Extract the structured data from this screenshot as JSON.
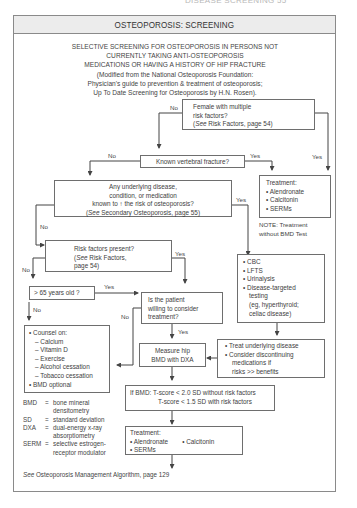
{
  "running_head": "DISEASE SCREENING  55",
  "title": "OSTEOPOROSIS: SCREENING",
  "intro": [
    "SELECTIVE SCREENING FOR OSTEOPOROSIS IN PERSONS NOT",
    "CURRENTLY TAKING ANTI-OSTEOPOROSIS",
    "MEDICATIONS OR HAVING A HISTORY OF HIP FRACTURE",
    "(Modified from the National Osteoporosis Foundation:",
    "Physician's guide to prevention & treatment of osteoporosis;",
    "Up To Date Screening for Osteoporosis by H.N. Rosen)."
  ],
  "nodes": {
    "female": {
      "lines": [
        "Female with multiple",
        "risk factors?"
      ],
      "ref_see": "See",
      "ref_rest": " Risk Factors, page 54)",
      "ref_open": "("
    },
    "vertebral": {
      "text": "Known vertebral fracture?"
    },
    "treatment_top": {
      "heading": "Treatment:",
      "items": [
        "Alendronate",
        "Calcitonin",
        "SERMs"
      ]
    },
    "note": {
      "lines": [
        "NOTE: Treatment",
        "without BMD Test"
      ]
    },
    "underlying": {
      "lines": [
        "Any underlying disease,",
        "condition, or medication",
        "known to ↑ the risk of osteoporosis?"
      ],
      "ref_open": "(",
      "ref_see": "See",
      "ref_rest": " Secondary Osteoporosis, page 55)"
    },
    "risk": {
      "line1": "Risk factors present?",
      "ref_open": "(",
      "ref_see": "See",
      "ref_rest": " Risk Factors,",
      "line3": "page 54)"
    },
    "labs": {
      "items": [
        "CBC",
        "LFTS",
        "Urinalysis",
        "Disease-targeted"
      ],
      "extra": [
        "testing",
        "(eg, hyperthyroid;",
        "celiac disease)"
      ]
    },
    "age": {
      "text": "> 65 years old ?"
    },
    "willing": {
      "lines": [
        "Is the patient",
        "willing to consider",
        "treatment?"
      ]
    },
    "counsel": {
      "heading": "Counsel on:",
      "subitems": [
        "Calcium",
        "Vitamin D",
        "Exercise",
        "Alcohol cessation",
        "Tobacco cessation"
      ],
      "last": "BMD optional"
    },
    "measure": {
      "lines": [
        "Measure hip",
        "BMD with DXA"
      ]
    },
    "treat_underlying": {
      "items": [
        "Treat underlying disease",
        "Consider discontinuing"
      ],
      "extra": [
        "medications if",
        "risks >> benefits"
      ]
    },
    "bmd": {
      "line1": "If BMD: T-score < 2.0 SD without risk factors",
      "line2": "T-score < 1.5 SD with risk factors"
    },
    "treatment_bottom": {
      "heading": "Treatment:",
      "items": [
        "Alendronate",
        "Calcitonin",
        "SERMs"
      ]
    }
  },
  "edge_labels": {
    "female_no": "No",
    "female_yes": "Yes",
    "vertebral_no": "No",
    "vertebral_yes": "Yes",
    "underlying_yes": "Yes",
    "underlying_no": "No",
    "risk_yes": "Yes",
    "risk_no": "No",
    "age_yes": "Yes",
    "age_no": "No",
    "willing_no": "No",
    "willing_yes": "Yes"
  },
  "legend": [
    {
      "abbr": "BMD",
      "def": [
        "bone mineral",
        "densitometry"
      ]
    },
    {
      "abbr": "SD",
      "def": [
        "standard deviation"
      ]
    },
    {
      "abbr": "DXA",
      "def": [
        "dual-energy x-ray",
        "absorptiometry"
      ]
    },
    {
      "abbr": "SERM",
      "def": [
        "selective estrogen-",
        "receptor modulator"
      ]
    }
  ],
  "footer": {
    "see": "See",
    "rest": " Osteoporosis Management Algorithm, page 129"
  },
  "colors": {
    "line": "#444444",
    "box_border": "#6e6e6e",
    "title_bg": "#ececec",
    "text": "#3e3e3e"
  }
}
